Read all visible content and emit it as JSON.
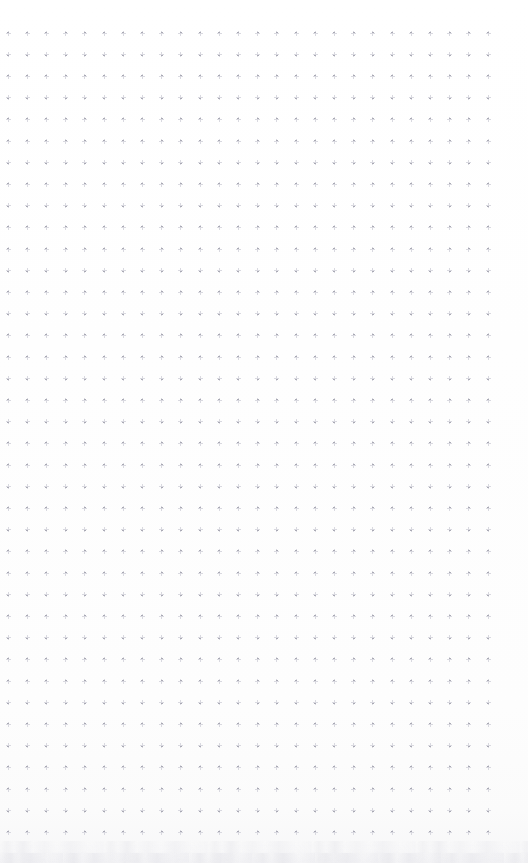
{
  "document": {
    "kind": "dot-grid-paper",
    "title": "Blank dot grid page",
    "page_label": "",
    "visible_text": "",
    "background_color": "#fefefe",
    "dot_color": "#a9a9b4",
    "dot_halo_color": "#d9d9e0",
    "bottom_edge_color": "#f2f2f5"
  },
  "grid": {
    "columns": 26,
    "rows": 38,
    "origin_x": 8,
    "origin_y": 33,
    "spacing_x": 19.2,
    "spacing_y": 21.6,
    "dot_size": 2,
    "glyph": "plus-cross-dot",
    "marks_total": 988
  },
  "canvas": {
    "width": 528,
    "height": 863
  }
}
